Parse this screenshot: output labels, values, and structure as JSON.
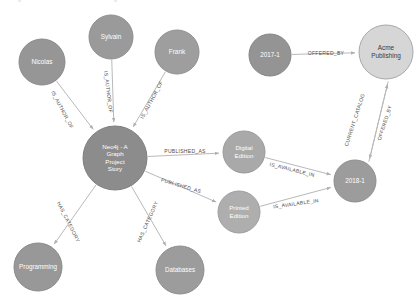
{
  "canvas": {
    "width": 418,
    "height": 301,
    "background": "#ffffff",
    "edge_color": "#b9b9b9",
    "edge_label_color": "#4a4a4a"
  },
  "graph": {
    "type": "node-link-graph",
    "nodes": [
      {
        "id": "nicolas",
        "label": "Nicolas",
        "cx": 42,
        "cy": 62,
        "r": 23,
        "fill": "#969696",
        "stroke": "#8a8a8a",
        "text": "light",
        "font_size": 6.4
      },
      {
        "id": "sylvain",
        "label": "Sylvain",
        "cx": 111,
        "cy": 37,
        "r": 22,
        "fill": "#9a9a9a",
        "stroke": "#8e8e8e",
        "text": "light",
        "font_size": 6.4
      },
      {
        "id": "frank",
        "label": "Frank",
        "cx": 177,
        "cy": 52,
        "r": 22,
        "fill": "#9e9e9e",
        "stroke": "#909090",
        "text": "light",
        "font_size": 6.4
      },
      {
        "id": "book",
        "label": "Neo4j - A Graph Project Story",
        "cx": 115,
        "cy": 158,
        "r": 32,
        "fill": "#8c8c8c",
        "stroke": "#7e7e7e",
        "text": "light",
        "font_size": 6.2
      },
      {
        "id": "digital",
        "label": "Digital Edition",
        "cx": 244,
        "cy": 152,
        "r": 21,
        "fill": "#a9a9a9",
        "stroke": "#9a9a9a",
        "text": "light",
        "font_size": 6.2
      },
      {
        "id": "printed",
        "label": "Printed Edition",
        "cx": 239,
        "cy": 212,
        "r": 21,
        "fill": "#aeaeae",
        "stroke": "#9e9e9e",
        "text": "light",
        "font_size": 6.2
      },
      {
        "id": "programming",
        "label": "Programming",
        "cx": 38,
        "cy": 267,
        "r": 24,
        "fill": "#989898",
        "stroke": "#8a8a8a",
        "text": "light",
        "font_size": 6.3
      },
      {
        "id": "databases",
        "label": "Databases",
        "cx": 180,
        "cy": 270,
        "r": 24,
        "fill": "#9c9c9c",
        "stroke": "#8e8e8e",
        "text": "light",
        "font_size": 6.3
      },
      {
        "id": "cat2017",
        "label": "2017-1",
        "cx": 270,
        "cy": 55,
        "r": 21,
        "fill": "#949494",
        "stroke": "#868686",
        "text": "light",
        "font_size": 6.3
      },
      {
        "id": "acme",
        "label": "Acme Publishing",
        "cx": 386,
        "cy": 52,
        "r": 27,
        "fill": "#d6d6d6",
        "stroke": "#a8a8a8",
        "text": "dark",
        "font_size": 6.4
      },
      {
        "id": "cat2018",
        "label": "2018-1",
        "cx": 355,
        "cy": 181,
        "r": 21,
        "fill": "#9c9c9c",
        "stroke": "#8e8e8e",
        "text": "light",
        "font_size": 6.3
      }
    ],
    "edges": [
      {
        "id": "e1",
        "source": "nicolas",
        "target": "book",
        "label": "IS_AUTHOR_OF",
        "label_x": 62,
        "label_y": 110,
        "label_rotate": 62
      },
      {
        "id": "e2",
        "source": "sylvain",
        "target": "book",
        "label": "IS_AUTHOR_OF",
        "label_x": 108,
        "label_y": 92,
        "label_rotate": 83
      },
      {
        "id": "e3",
        "source": "frank",
        "target": "book",
        "label": "IS_AUTHOR_OF",
        "label_x": 152,
        "label_y": 100,
        "label_rotate": -62
      },
      {
        "id": "e4",
        "source": "book",
        "target": "digital",
        "label": "PUBLISHED_AS",
        "label_x": 185,
        "label_y": 152,
        "label_rotate": 0
      },
      {
        "id": "e5",
        "source": "book",
        "target": "printed",
        "label": "PUBLISHED_AS",
        "label_x": 181,
        "label_y": 186,
        "label_rotate": 17
      },
      {
        "id": "e6",
        "source": "book",
        "target": "programming",
        "label": "HAS_CATEGORY",
        "label_x": 68,
        "label_y": 222,
        "label_rotate": 63
      },
      {
        "id": "e7",
        "source": "book",
        "target": "databases",
        "label": "HAS_CATEGORY",
        "label_x": 148,
        "label_y": 222,
        "label_rotate": -66
      },
      {
        "id": "e8",
        "source": "digital",
        "target": "cat2018",
        "label": "IS_AVAILABLE_IN",
        "label_x": 292,
        "label_y": 170,
        "label_rotate": 14
      },
      {
        "id": "e9",
        "source": "printed",
        "target": "cat2018",
        "label": "IS_AVAILABLE_IN",
        "label_x": 296,
        "label_y": 204,
        "label_rotate": -8
      },
      {
        "id": "e10",
        "source": "cat2017",
        "target": "acme",
        "label": "OFFERED_BY",
        "label_x": 326,
        "label_y": 54,
        "label_rotate": 0
      },
      {
        "id": "e11",
        "source": "acme",
        "target": "cat2018",
        "label": "CURRENT_CATALOG",
        "label_x": 355,
        "label_y": 120,
        "label_rotate": -72
      },
      {
        "id": "e12",
        "source": "cat2018",
        "target": "acme",
        "label": "OFFERED_BY",
        "label_x": 385,
        "label_y": 123,
        "label_rotate": -72
      }
    ]
  }
}
